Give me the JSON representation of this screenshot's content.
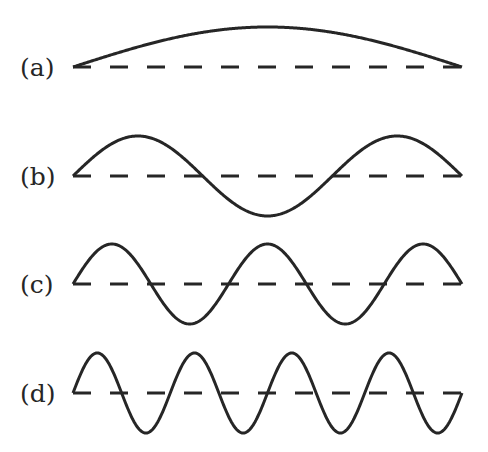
{
  "figure": {
    "stroke_color": "#262626",
    "background": "#ffffff",
    "x_start": 73,
    "x_end": 462,
    "amplitude": 40,
    "panels": [
      {
        "label": "(a)",
        "baseline_y": 67,
        "half_wavelengths": 1,
        "label_x": 20,
        "label_y": 55
      },
      {
        "label": "(b)",
        "baseline_y": 176,
        "half_wavelengths": 3,
        "label_x": 20,
        "label_y": 164
      },
      {
        "label": "(c)",
        "baseline_y": 284,
        "half_wavelengths": 5,
        "label_x": 20,
        "label_y": 272
      },
      {
        "label": "(d)",
        "baseline_y": 393,
        "half_wavelengths": 8,
        "label_x": 20,
        "label_y": 381
      }
    ]
  },
  "chart_data": {
    "type": "line",
    "title": "",
    "xlabel": "",
    "ylabel": "",
    "series": [
      {
        "name": "(a)",
        "function": "sin",
        "cycles": 0.5,
        "amplitude": 1
      },
      {
        "name": "(b)",
        "function": "sin",
        "cycles": 1.5,
        "amplitude": 1
      },
      {
        "name": "(c)",
        "function": "sin",
        "cycles": 2.5,
        "amplitude": 1
      },
      {
        "name": "(d)",
        "function": "sin",
        "cycles": 4,
        "amplitude": 1
      }
    ],
    "baseline": "dashed horizontal line at zero for each panel"
  }
}
